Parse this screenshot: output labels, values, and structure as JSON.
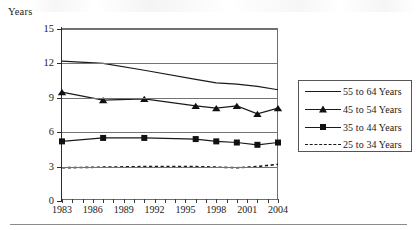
{
  "chart_data": {
    "type": "line",
    "title": "",
    "ylabel": "Years",
    "xlabel": "",
    "ylim": [
      0,
      15
    ],
    "yticks": [
      0,
      3,
      6,
      9,
      12,
      15
    ],
    "ytick_labels": [
      "0",
      "3",
      "6",
      "9",
      "12",
      "15"
    ],
    "xlim": [
      1983,
      2004
    ],
    "xticks": [
      1983,
      1984,
      1985,
      1986,
      1987,
      1988,
      1989,
      1990,
      1991,
      1992,
      1993,
      1994,
      1995,
      1996,
      1997,
      1998,
      1999,
      2000,
      2001,
      2002,
      2003,
      2004
    ],
    "xtick_labels": [
      "1983",
      "1986",
      "1989",
      "1992",
      "1995",
      "1998",
      "2001",
      "2004"
    ],
    "xtick_label_years": [
      1983,
      1986,
      1989,
      1992,
      1995,
      1998,
      2001,
      2004
    ],
    "grid": true,
    "grid_axis": "y",
    "legend_position": "right-outside",
    "x": [
      1983,
      1987,
      1991,
      1996,
      1998,
      2000,
      2002,
      2004
    ],
    "series": [
      {
        "name": "55 to 64 Years",
        "marker": "none",
        "line_style": "solid",
        "values": [
          12.2,
          12.0,
          11.4,
          10.6,
          10.3,
          10.2,
          10.0,
          9.7
        ]
      },
      {
        "name": "45 to 54 Years",
        "marker": "triangle",
        "line_style": "solid",
        "values": [
          9.5,
          8.8,
          8.9,
          8.3,
          8.1,
          8.3,
          7.6,
          8.1
        ]
      },
      {
        "name": "35 to 44 Years",
        "marker": "square",
        "line_style": "solid",
        "values": [
          5.2,
          5.5,
          5.5,
          5.4,
          5.2,
          5.1,
          4.9,
          5.1
        ]
      },
      {
        "name": "25 to 34 Years",
        "marker": "none",
        "line_style": "dashed",
        "values": [
          2.9,
          2.95,
          3.0,
          3.0,
          2.95,
          2.9,
          3.0,
          3.2
        ]
      }
    ]
  },
  "legend": {
    "entries": [
      {
        "label": "55 to 64 Years",
        "key": "line"
      },
      {
        "label": "45 to 54 Years",
        "key": "line-triangle"
      },
      {
        "label": "35 to 44 Years",
        "key": "line-square"
      },
      {
        "label": "25 to 34 Years",
        "key": "dashed"
      }
    ]
  }
}
